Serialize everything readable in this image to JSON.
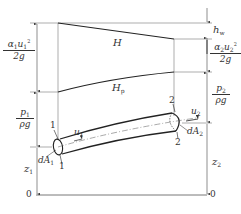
{
  "diagram": {
    "type": "energy-grade-line-stream-tube",
    "labels": {
      "total_head_line": "H",
      "piezometric_line_main": "H",
      "piezometric_line_sub": "p",
      "head_loss_main": "h",
      "head_loss_sub": "w",
      "velocity_head_1": {
        "num_a": "α",
        "num_a_sub": "1",
        "num_u": "u",
        "num_u_sub": "1",
        "num_u_sup": "2",
        "den": "2g"
      },
      "velocity_head_2": {
        "num_a": "α",
        "num_a_sub": "2",
        "num_u": "u",
        "num_u_sub": "2",
        "num_u_sup": "2",
        "den": "2g"
      },
      "pressure_head_1": {
        "num": "p",
        "num_sub": "1",
        "den": "ρg"
      },
      "pressure_head_2": {
        "num": "p",
        "num_sub": "2",
        "den": "ρg"
      },
      "elevation_1": {
        "main": "z",
        "sub": "1"
      },
      "elevation_2": {
        "main": "z",
        "sub": "2"
      },
      "velocity_1": {
        "main": "u",
        "sub": "1"
      },
      "velocity_2": {
        "main": "u",
        "sub": "2"
      },
      "area_1": {
        "main": "dA",
        "sub": "1"
      },
      "area_2": {
        "main": "dA",
        "sub": "2"
      },
      "section_1_top": "1",
      "section_1_bottom": "1",
      "section_2_top": "2",
      "section_2_bottom": "2",
      "datum_left": "0",
      "datum_right": "0"
    },
    "colors": {
      "line": "#333333",
      "thin_line": "#666666",
      "background": "#ffffff"
    }
  }
}
